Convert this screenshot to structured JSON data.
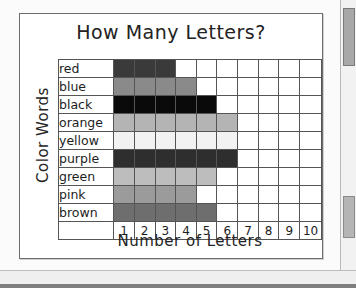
{
  "document": {
    "type": "worksheet-bar-graph"
  },
  "chart_data": {
    "type": "bar",
    "orientation": "horizontal",
    "title": "How Many Letters?",
    "xlabel": "Number of Letters",
    "ylabel": "Color Words",
    "categories": [
      "red",
      "blue",
      "black",
      "orange",
      "yellow",
      "purple",
      "green",
      "pink",
      "brown"
    ],
    "values": [
      3,
      4,
      5,
      6,
      6,
      6,
      5,
      4,
      5
    ],
    "xticks": [
      "1",
      "2",
      "3",
      "4",
      "5",
      "6",
      "7",
      "8",
      "9",
      "10"
    ],
    "xlim": [
      0,
      10
    ],
    "grid": true,
    "legend": "none",
    "bar_colors": [
      "#3a3a3a",
      "#8a8a8a",
      "#0a0a0a",
      "#b4b4b4",
      "#f2f2f2",
      "#2e2e2e",
      "#bdbdbd",
      "#9b9b9b",
      "#6e6e6e"
    ],
    "cell_empty_color": "#ffffff",
    "grid_line_color": "#555555"
  },
  "scrollbar": {
    "present": true
  }
}
